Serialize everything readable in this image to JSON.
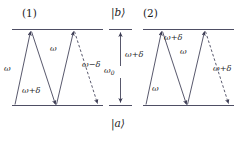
{
  "figure": {
    "type": "energy-level-ladder-diagram",
    "background_color": "#ffffff",
    "line_color": "#3a3a52",
    "panels": [
      {
        "id": "panel-1",
        "label": "(1)",
        "transitions": [
          {
            "order": 1,
            "direction": "up",
            "style": "solid",
            "label": "ω"
          },
          {
            "order": 2,
            "direction": "down",
            "style": "solid",
            "label": "ω+δ"
          },
          {
            "order": 3,
            "direction": "up",
            "style": "solid",
            "label": "ω"
          },
          {
            "order": 4,
            "direction": "down",
            "style": "dashed",
            "label": "ω−δ"
          }
        ]
      },
      {
        "id": "panel-2",
        "label": "(2)",
        "transitions": [
          {
            "order": 1,
            "direction": "up",
            "style": "solid",
            "label": "ω"
          },
          {
            "order": 2,
            "direction": "down",
            "style": "solid",
            "label": "ω+δ"
          },
          {
            "order": 3,
            "direction": "up",
            "style": "solid",
            "label": "ω"
          },
          {
            "order": 4,
            "direction": "down",
            "style": "dashed",
            "label": "ω+δ"
          }
        ]
      }
    ],
    "center": {
      "upper_state": "|b⟩",
      "lower_state": "|a⟩",
      "splitting_label": "ω",
      "splitting_subscript": "0",
      "detuning_label": "ω+δ"
    },
    "panel_1_labels": {
      "number": "(1)",
      "left_up": "ω",
      "mid_down": "ω+δ",
      "mid_up": "ω",
      "right_down": "ω−δ"
    },
    "panel_2_labels": {
      "number": "(2)",
      "left_up": "ω",
      "mid_down": "ω+δ",
      "mid_up": "ω",
      "right_down": "ω+δ"
    }
  }
}
